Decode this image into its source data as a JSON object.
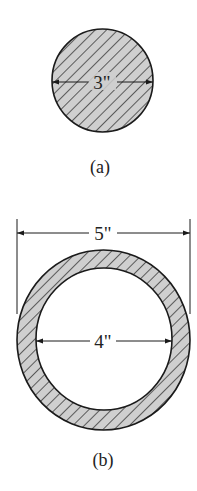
{
  "figure_a": {
    "dimension_label": "3\"",
    "caption": "(a)",
    "shape": "solid circular cross-section",
    "diameter_in": 3
  },
  "figure_b": {
    "outer_dimension_label": "5\"",
    "inner_dimension_label": "4\"",
    "caption": "(b)",
    "shape": "hollow circular (tube) cross-section",
    "outer_diameter_in": 5,
    "inner_diameter_in": 4
  },
  "colors": {
    "hatch_fill": "#cfcfcf",
    "line": "#1a1a1a",
    "background": "#ffffff"
  }
}
